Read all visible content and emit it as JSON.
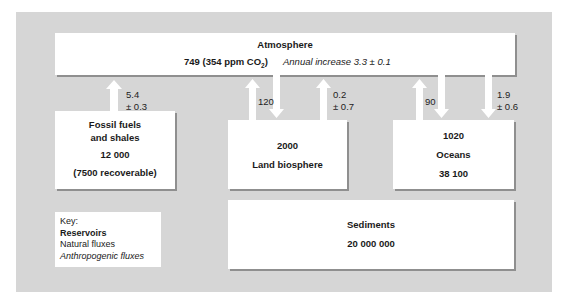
{
  "atmosphere": {
    "title": "Atmosphere",
    "amount": "749 (354 ppm CO",
    "amount_sub": "2",
    "amount_close": ")",
    "annual_increase": "Annual increase 3.3 ± 0.1"
  },
  "fossil": {
    "title_line1": "Fossil fuels",
    "title_line2": "and shales",
    "amount": "12 000",
    "note": "(7500 recoverable)"
  },
  "land": {
    "amount": "2000",
    "title": "Land biosphere"
  },
  "oceans": {
    "amount_top": "1020",
    "title": "Oceans",
    "amount_bottom": "38 100"
  },
  "sediments": {
    "title": "Sediments",
    "amount": "20 000 000"
  },
  "fluxes": {
    "fossil_to_atm": {
      "line1": "5.4",
      "line2": "± 0.3",
      "type": "anthropogenic",
      "direction": "up"
    },
    "land_exchange": {
      "label": "120",
      "type": "natural",
      "direction": "both"
    },
    "land_to_atm": {
      "line1": "0.2",
      "line2": "± 0.7",
      "type": "anthropogenic",
      "direction": "up"
    },
    "ocean_exchange": {
      "label": "90",
      "type": "natural",
      "direction": "both"
    },
    "atm_to_ocean": {
      "line1": "1.9",
      "line2": "± 0.6",
      "type": "anthropogenic",
      "direction": "down"
    }
  },
  "key": {
    "heading": "Key:",
    "reservoirs": "Reservoirs",
    "natural": "Natural fluxes",
    "anthropogenic": "Anthropogenic fluxes"
  },
  "colors": {
    "background": "#d6d6d6",
    "box": "#ffffff",
    "shadow": "#8f8f8f",
    "arrow": "#ffffff"
  }
}
